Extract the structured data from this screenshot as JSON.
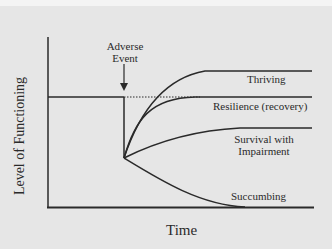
{
  "diagram": {
    "y_axis_label": "Level of Functioning",
    "x_axis_label": "Time",
    "event_label_line1": "Adverse",
    "event_label_line2": "Event",
    "outcomes": [
      {
        "name": "thriving",
        "label": "Thriving"
      },
      {
        "name": "resilience",
        "label": "Resilience (recovery)"
      },
      {
        "name": "survival",
        "label_line1": "Survival with",
        "label_line2": "Impairment"
      },
      {
        "name": "succumbing",
        "label": "Succumbing"
      }
    ],
    "colors": {
      "background": "#e6e6e6",
      "line": "#2a2a2a"
    }
  }
}
